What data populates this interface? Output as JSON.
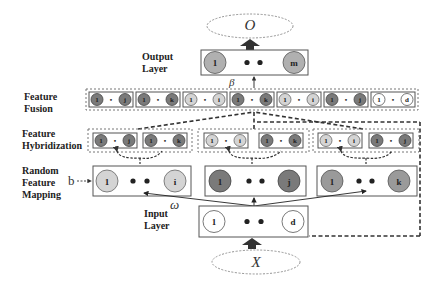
{
  "diagram": {
    "output_symbol": "O",
    "input_symbol": "X",
    "beta": "β",
    "omega": "ω",
    "bias": "b",
    "layers": {
      "output": [
        "Output",
        "Layer"
      ],
      "fusion": [
        "Feature",
        "Fusion"
      ],
      "hybridization": [
        "Feature",
        "Hybridization"
      ],
      "mapping": [
        "Random",
        "Feature",
        "Mapping"
      ],
      "input": [
        "Input",
        "Layer"
      ]
    },
    "output_layer": {
      "first": "1",
      "last": "m"
    },
    "input_layer": {
      "first": "1",
      "last": "d"
    },
    "mapping_groups": [
      {
        "first": "1",
        "last": "i",
        "shade": "light"
      },
      {
        "first": "1",
        "last": "j",
        "shade": "dark"
      },
      {
        "first": "1",
        "last": "k",
        "shade": "mid"
      }
    ],
    "hybridization_groups": [
      [
        {
          "a": "1",
          "b": "j"
        },
        {
          "a": "1",
          "b": "k"
        }
      ],
      [
        {
          "a": "1",
          "b": "i"
        },
        {
          "a": "1",
          "b": "k"
        }
      ],
      [
        {
          "a": "1",
          "b": "i"
        },
        {
          "a": "1",
          "b": "j"
        }
      ]
    ],
    "fusion_pairs": [
      {
        "a": "1",
        "b": "j"
      },
      {
        "a": "1",
        "b": "k"
      },
      {
        "a": "1",
        "b": "i"
      },
      {
        "a": "1",
        "b": "k"
      },
      {
        "a": "1",
        "b": "i"
      },
      {
        "a": "1",
        "b": "j"
      },
      {
        "a": "1",
        "b": "d"
      }
    ],
    "dot_separator": "•"
  }
}
